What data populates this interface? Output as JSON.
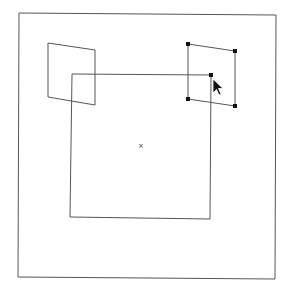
{
  "canvas": {
    "width": 288,
    "height": 298,
    "background": "#ffffff",
    "stroke_color": "#555555",
    "handle_color": "#111111"
  },
  "frame": {
    "points": "19,13 276,15 275,279 18,277"
  },
  "shapes": [
    {
      "name": "left-parallelogram",
      "points": "48,43 95,50 95,105 48,97",
      "selected": false
    },
    {
      "name": "right-parallelogram",
      "points": "188,44 235,51 235,106 188,99",
      "selected": true,
      "handles": [
        [
          188,
          44
        ],
        [
          235,
          51
        ],
        [
          235,
          106
        ],
        [
          188,
          99
        ]
      ]
    },
    {
      "name": "center-square",
      "points": "72,74 211,75 210,219 70,217",
      "selected": false,
      "handles": [
        [
          211,
          75
        ]
      ]
    }
  ],
  "center_mark": {
    "x": 141,
    "y": 146,
    "glyph": "×"
  },
  "cursor": {
    "x": 213,
    "y": 79,
    "icon": "arrow-cursor-icon"
  }
}
